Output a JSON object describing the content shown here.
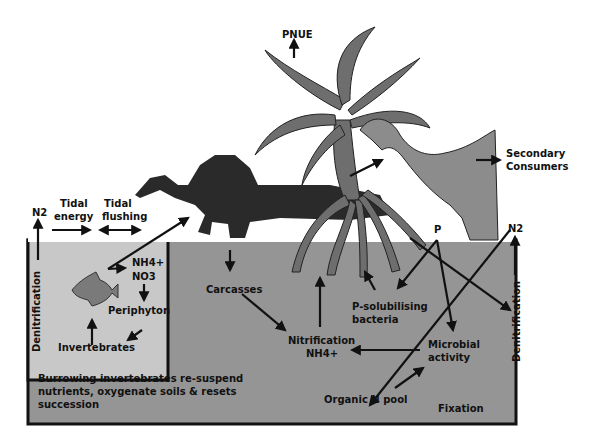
{
  "colors": {
    "background": "#ffffff",
    "sediment_dark": "#959595",
    "sediment_light": "#c8c8c8",
    "mangrove": "#6e6e6e",
    "heron": "#8c8c8c",
    "dinosaur": "#2a2a2a",
    "fish": "#7a7a7a",
    "ink": "#111111"
  },
  "labels": {
    "pnue": "PNUE",
    "secondary_consumers_1": "Secondary",
    "secondary_consumers_2": "Consumers",
    "n2_left": "N2",
    "tidal_energy_1": "Tidal",
    "tidal_energy_2": "energy",
    "tidal_flushing_1": "Tidal",
    "tidal_flushing_2": "flushing",
    "denitrification_left": "Denitrification",
    "nh4": "NH4+",
    "no3": "NO3",
    "periphyton": "Periphyton",
    "invertebrates": "Invertebrates",
    "burrowing": "Burrowing invertebrates re-suspend nutrients, oxygenate soils & resets succession",
    "carcasses": "Carcasses",
    "nitrification_1": "Nitrification",
    "nitrification_2": "NH4+",
    "p_solubilising_1": "P-solubilising",
    "p_solubilising_2": "bacteria",
    "p": "P",
    "n2_right": "N2",
    "microbial_1": "Microbial",
    "microbial_2": "activity",
    "organic_n_pool": "Organic N pool",
    "fixation": "Fixation",
    "denitrification_right": "Denitrification"
  }
}
